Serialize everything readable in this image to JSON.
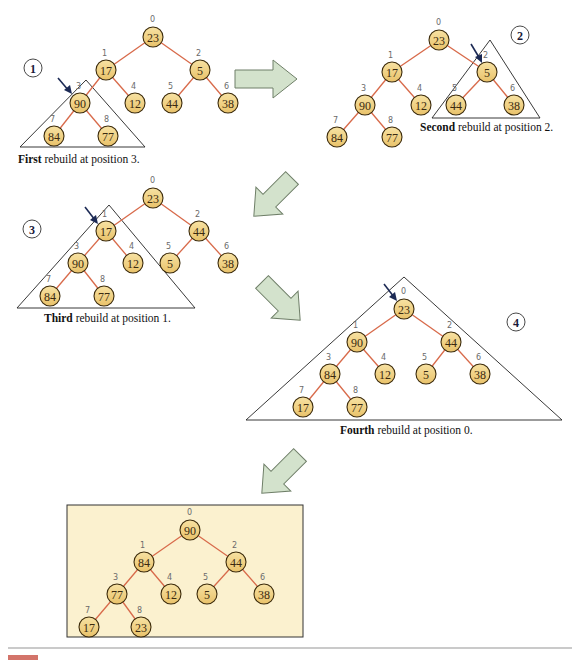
{
  "colors": {
    "node_fill": "#f2d27f",
    "node_stroke": "#3b2a0a",
    "edge": "#d86a4a",
    "triangle": "#222222",
    "pointer_arrow": "#1c2a55",
    "flow_arrow_fill": "#d3e2cc",
    "flow_arrow_stroke": "#6f7f68",
    "final_panel_bg": "#fbf1cf",
    "final_panel_border": "#333333",
    "divider": "#b9b9b9",
    "figure_caption": "#c0392b"
  },
  "steps": [
    {
      "number": "1",
      "caption_bold": "First",
      "caption_rest": " rebuild at position 3.",
      "values": [
        "23",
        "17",
        "5",
        "90",
        "12",
        "44",
        "38",
        "84",
        "77"
      ]
    },
    {
      "number": "2",
      "caption_bold": "Second",
      "caption_rest": " rebuild at position 2.",
      "values": [
        "23",
        "17",
        "5",
        "90",
        "12",
        "44",
        "38",
        "84",
        "77"
      ]
    },
    {
      "number": "3",
      "caption_bold": "Third",
      "caption_rest": " rebuild at position 1.",
      "values": [
        "23",
        "17",
        "44",
        "90",
        "12",
        "5",
        "38",
        "84",
        "77"
      ]
    },
    {
      "number": "4",
      "caption_bold": "Fourth",
      "caption_rest": " rebuild at position 0.",
      "values": [
        "23",
        "90",
        "44",
        "84",
        "12",
        "5",
        "38",
        "17",
        "77"
      ]
    }
  ],
  "final": {
    "values": [
      "90",
      "84",
      "44",
      "77",
      "12",
      "5",
      "38",
      "17",
      "23"
    ]
  },
  "indices": [
    "0",
    "1",
    "2",
    "3",
    "4",
    "5",
    "6",
    "7",
    "8"
  ],
  "figure_caption_visible": "Figure"
}
